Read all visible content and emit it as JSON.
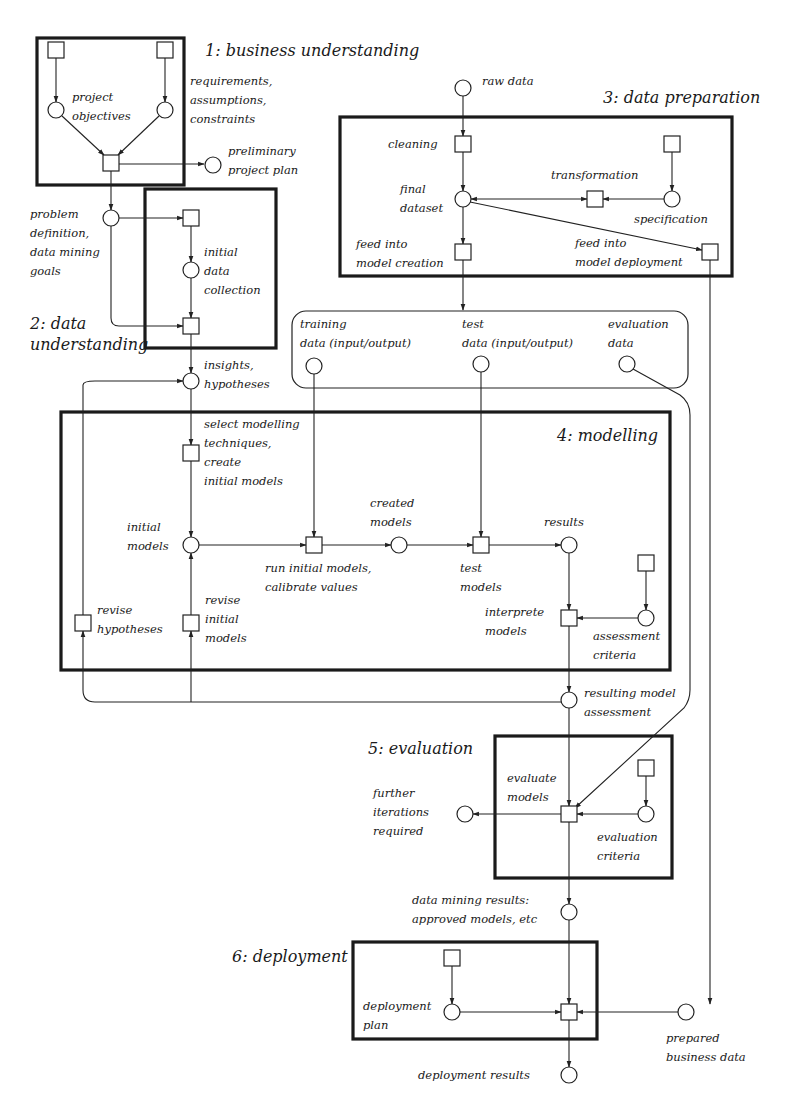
{
  "diagram": {
    "type": "CRISP-DM process flow",
    "colors": {
      "ink": "#1a1a1a",
      "background": "#ffffff"
    },
    "phases": [
      {
        "id": "p1",
        "title": "1: business understanding"
      },
      {
        "id": "p2",
        "title_line1": "2: data",
        "title_line2": "understanding"
      },
      {
        "id": "p3",
        "title": "3: data preparation"
      },
      {
        "id": "p4",
        "title": "4: modelling"
      },
      {
        "id": "p5",
        "title": "5: evaluation"
      },
      {
        "id": "p6",
        "title": "6: deployment"
      }
    ],
    "labels": {
      "project_objectives": [
        "project",
        "objectives"
      ],
      "requirements": [
        "requirements,",
        "assumptions,",
        "constraints"
      ],
      "preliminary_plan": [
        "preliminary",
        "project plan"
      ],
      "problem_definition": [
        "problem",
        "definition,",
        "data mining",
        "goals"
      ],
      "initial_data_collection": [
        "initial",
        "data",
        "collection"
      ],
      "insights": [
        "insights,",
        "hypotheses"
      ],
      "raw_data": "raw data",
      "cleaning": "cleaning",
      "final_dataset": [
        "final",
        "dataset"
      ],
      "transformation": "transformation",
      "specification": "specification",
      "feed_creation": [
        "feed into",
        "model creation"
      ],
      "feed_deployment": [
        "feed into",
        "model deployment"
      ],
      "training_data": [
        "training",
        "data (input/output)"
      ],
      "test_data": [
        "test",
        "data (input/output)"
      ],
      "evaluation_data": [
        "evaluation",
        "data"
      ],
      "select_techniques": [
        "select modelling",
        "techniques,",
        "create",
        "initial models"
      ],
      "initial_models": [
        "initial",
        "models"
      ],
      "run_initial": [
        "run initial models,",
        "calibrate values"
      ],
      "created_models": [
        "created",
        "models"
      ],
      "test_models": [
        "test",
        "models"
      ],
      "results": "results",
      "interprete_models": [
        "interprete",
        "models"
      ],
      "assessment_criteria": [
        "assessment",
        "criteria"
      ],
      "revise_hypotheses": [
        "revise",
        "hypotheses"
      ],
      "revise_initial": [
        "revise",
        "initial",
        "models"
      ],
      "resulting_assessment": [
        "resulting model",
        "assessment"
      ],
      "evaluate_models": [
        "evaluate",
        "models"
      ],
      "further_iterations": [
        "further",
        "iterations",
        "required"
      ],
      "evaluation_criteria": [
        "evaluation",
        "criteria"
      ],
      "dm_results": [
        "data mining results:",
        "approved models, etc"
      ],
      "deployment_plan": [
        "deployment",
        "plan"
      ],
      "prepared_business": [
        "prepared",
        "business data"
      ],
      "deployment_results": "deployment results"
    },
    "legend": {
      "square": "process/activity",
      "circle": "data/result"
    }
  }
}
